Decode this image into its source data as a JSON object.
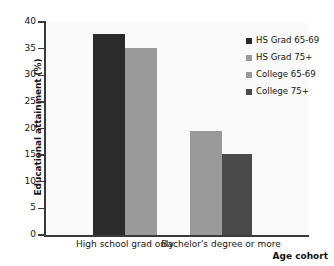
{
  "chart_data": {
    "type": "bar",
    "title": "",
    "xlabel": "Age cohort",
    "ylabel": "Educational attainment (%)",
    "categories": [
      "High school grad only",
      "Bachelor's degree or more"
    ],
    "ylim": [
      0,
      40
    ],
    "yticks": [
      0,
      5,
      10,
      15,
      20,
      25,
      30,
      35,
      40
    ],
    "ytick_labels": [
      "0",
      "5",
      "10",
      "15",
      "20",
      "25",
      "30",
      "35",
      "40"
    ],
    "grid": false,
    "legend_position": "top-right",
    "series": [
      {
        "name": "HS Grad 65-69",
        "color": "#2b2b2b",
        "values": [
          37.8,
          null
        ]
      },
      {
        "name": "HS Grad 75+",
        "color": "#9a9a9a",
        "values": [
          35.1,
          null
        ]
      },
      {
        "name": "College 65-69",
        "color": "#9a9a9a",
        "values": [
          null,
          19.5
        ]
      },
      {
        "name": "College 75+",
        "color": "#4a4a4a",
        "values": [
          null,
          15.3
        ]
      }
    ],
    "bars": [
      {
        "label": "HS Grad 65-69",
        "category": "High school grad only",
        "value": 37.8,
        "color": "#2b2b2b"
      },
      {
        "label": "HS Grad 75+",
        "category": "High school grad only",
        "value": 35.1,
        "color": "#9a9a9a"
      },
      {
        "label": "College 65-69",
        "category": "Bachelor's degree or more",
        "value": 19.5,
        "color": "#9a9a9a"
      },
      {
        "label": "College 75+",
        "category": "Bachelor's degree or more",
        "value": 15.3,
        "color": "#4a4a4a"
      }
    ]
  },
  "legend": {
    "items": [
      {
        "label": "HS Grad 65-69",
        "color": "#2b2b2b"
      },
      {
        "label": "HS Grad 75+",
        "color": "#9a9a9a"
      },
      {
        "label": "College 65-69",
        "color": "#9a9a9a"
      },
      {
        "label": "College 75+",
        "color": "#4a4a4a"
      }
    ]
  },
  "axes": {
    "y_title": "Educational attainment (%)",
    "x_title": "Age cohort"
  },
  "colors": {
    "plot_background": "#fafafa",
    "page_background": "#ffffff",
    "axis": "#3a3a3a",
    "text": "#141414"
  }
}
